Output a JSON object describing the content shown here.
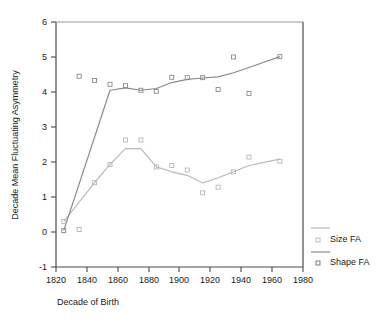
{
  "chart_data": {
    "type": "line",
    "title": "",
    "subtitle": "",
    "xlabel": "Decade of Birth",
    "ylabel": "Decade Mean Fluctuating Asymmetry",
    "xlim": [
      1820,
      1980
    ],
    "ylim": [
      -1,
      6
    ],
    "xticks": [
      1820,
      1840,
      1860,
      1880,
      1900,
      1920,
      1940,
      1960,
      1980
    ],
    "xticklabels": [
      "1820",
      "1840",
      "1860",
      "1880",
      "1900",
      "1920",
      "1940",
      "1960",
      "1980"
    ],
    "yticks": [
      -1,
      0,
      1,
      2,
      3,
      4,
      5,
      6
    ],
    "yticklabels": [
      "-1",
      "0",
      "1",
      "2",
      "3",
      "4",
      "5",
      "6"
    ],
    "grid": false,
    "legend_position": "right",
    "x": [
      1825,
      1835,
      1845,
      1855,
      1865,
      1875,
      1885,
      1895,
      1905,
      1915,
      1925,
      1935,
      1945,
      1965
    ],
    "series": [
      {
        "name": "Size FA",
        "color": "#b8b8b8",
        "marker": "square-open",
        "values": [
          0.3,
          0.07,
          1.41,
          1.93,
          2.63,
          2.63,
          1.86,
          1.9,
          1.77,
          1.12,
          1.28,
          1.72,
          2.14,
          2.02
        ],
        "line_values": [
          0.3,
          null,
          1.41,
          1.93,
          2.38,
          2.38,
          1.86,
          1.72,
          1.62,
          1.4,
          1.55,
          1.72,
          1.9,
          2.08
        ]
      },
      {
        "name": "Shape FA",
        "color": "#8a8a8a",
        "marker": "square-open",
        "values": [
          0.04,
          4.45,
          4.33,
          4.22,
          4.18,
          4.05,
          4.02,
          4.42,
          4.41,
          4.41,
          4.07,
          5.0,
          3.96,
          5.01
        ],
        "line_values": [
          0.04,
          null,
          null,
          4.05,
          4.12,
          4.05,
          4.1,
          4.27,
          4.36,
          4.4,
          4.43,
          4.55,
          4.7,
          5.01
        ]
      }
    ],
    "annotations": []
  },
  "legend": {
    "entries": [
      {
        "label": "Size FA",
        "swatch_name": "size-fa-swatch"
      },
      {
        "label": "Shape FA",
        "swatch_name": "shape-fa-swatch"
      }
    ]
  },
  "colors": {
    "size_fa": "#b8b8b8",
    "shape_fa": "#8a8a8a",
    "axis": "#4a4a4a",
    "text": "#1a1a1a",
    "background": "#ffffff"
  }
}
